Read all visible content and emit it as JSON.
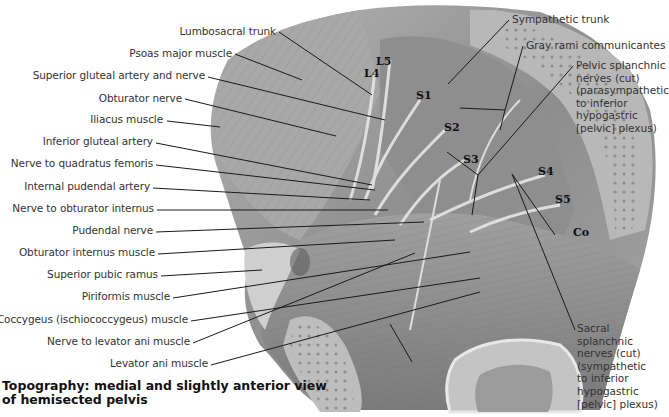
{
  "figure": {
    "title": "Topography: medial and slightly anterior view of hemisected pelvis",
    "caption_line1": "Topography: medial and slightly anterior view",
    "caption_line2": "of hemisected pelvis"
  },
  "left_labels": [
    {
      "text": "Lumbosacral trunk",
      "x": 278,
      "y": 32
    },
    {
      "text": "Psoas major muscle",
      "x": 234,
      "y": 54
    },
    {
      "text": "Superior gluteal artery and nerve",
      "x": 207,
      "y": 76
    },
    {
      "text": "Obturator nerve",
      "x": 184,
      "y": 99
    },
    {
      "text": "Iliacus muscle",
      "x": 165,
      "y": 120
    },
    {
      "text": "Inferior gluteal artery",
      "x": 155,
      "y": 142
    },
    {
      "text": "Nerve to quadratus femoris",
      "x": 155,
      "y": 164
    },
    {
      "text": "Internal pudendal artery",
      "x": 152,
      "y": 187
    },
    {
      "text": "Nerve to obturator internus",
      "x": 156,
      "y": 209
    },
    {
      "text": "Pudendal nerve",
      "x": 155,
      "y": 231
    },
    {
      "text": "Obturator internus muscle",
      "x": 157,
      "y": 253
    },
    {
      "text": "Superior pubic ramus",
      "x": 160,
      "y": 275
    },
    {
      "text": "Piriformis muscle",
      "x": 172,
      "y": 297
    },
    {
      "text": "Coccygeus (ischiococcygeus) muscle",
      "x": 190,
      "y": 320
    },
    {
      "text": "Nerve to levator ani muscle",
      "x": 192,
      "y": 342
    },
    {
      "text": "Levator ani muscle",
      "x": 210,
      "y": 364
    }
  ],
  "right_labels": [
    {
      "text": "Sympathetic trunk",
      "x": 510,
      "y": 20
    },
    {
      "text": "Gray rami communicantes",
      "x": 524,
      "y": 46
    },
    {
      "text": "Pelvic splanchnic\nnerves (cut)\n(parasympathetic\nto inferior\nhypogastric\n[pelvic] plexus)",
      "x": 574,
      "y": 66
    },
    {
      "text": "Sacral\nsplanchnic\nnerves (cut)\n(sympathetic\nto inferior\nhypogastric\n[pelvic] plexus)",
      "x": 575,
      "y": 329
    }
  ],
  "segment_labels": [
    {
      "text": "L4",
      "x": 364,
      "y": 74
    },
    {
      "text": "L5",
      "x": 376,
      "y": 62
    },
    {
      "text": "S1",
      "x": 416,
      "y": 96
    },
    {
      "text": "S2",
      "x": 444,
      "y": 128
    },
    {
      "text": "S3",
      "x": 463,
      "y": 160
    },
    {
      "text": "S4",
      "x": 538,
      "y": 172
    },
    {
      "text": "S5",
      "x": 555,
      "y": 200
    },
    {
      "text": "Co",
      "x": 573,
      "y": 233
    }
  ],
  "colors": {
    "background": "#ffffff",
    "tissue_light": "#c9c9c9",
    "tissue_mid": "#9a9a9a",
    "tissue_dark": "#6e6e6e",
    "leader_line": "#1a1a1a",
    "label_text": "#333333"
  }
}
